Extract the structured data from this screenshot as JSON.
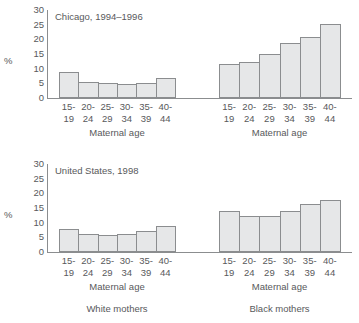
{
  "chart_data": [
    {
      "type": "bar",
      "title": "Chicago, 1994–1996",
      "xlabel": "Maternal age",
      "ylabel": "%",
      "ylim": [
        0,
        30
      ],
      "yticks": [
        30,
        25,
        20,
        15,
        10,
        5,
        0
      ],
      "grid": false,
      "legend": "none",
      "categories": [
        "15-19",
        "20-24",
        "25-29",
        "30-34",
        "35-39",
        "40-44"
      ],
      "category_lines": [
        {
          "l1": "15-",
          "l2": "19"
        },
        {
          "l1": "20-",
          "l2": "24"
        },
        {
          "l1": "25-",
          "l2": "29"
        },
        {
          "l1": "30-",
          "l2": "34"
        },
        {
          "l1": "35-",
          "l2": "39"
        },
        {
          "l1": "40-",
          "l2": "44"
        }
      ],
      "series": [
        {
          "name": "White mothers",
          "values": [
            9.0,
            5.5,
            5.0,
            4.7,
            5.1,
            6.7
          ]
        },
        {
          "name": "Black mothers",
          "values": [
            11.5,
            12.2,
            14.9,
            18.6,
            20.9,
            25.3
          ]
        }
      ]
    },
    {
      "type": "bar",
      "title": "United States, 1998",
      "xlabel": "Maternal age",
      "ylabel": "%",
      "ylim": [
        0,
        30
      ],
      "yticks": [
        30,
        25,
        20,
        15,
        10,
        5,
        0
      ],
      "grid": false,
      "legend": "none",
      "categories": [
        "15-19",
        "20-24",
        "25-29",
        "30-34",
        "35-39",
        "40-44"
      ],
      "category_lines": [
        {
          "l1": "15-",
          "l2": "19"
        },
        {
          "l1": "20-",
          "l2": "24"
        },
        {
          "l1": "25-",
          "l2": "29"
        },
        {
          "l1": "30-",
          "l2": "34"
        },
        {
          "l1": "35-",
          "l2": "39"
        },
        {
          "l1": "40-",
          "l2": "44"
        }
      ],
      "series": [
        {
          "name": "White mothers",
          "values": [
            8.0,
            6.3,
            5.7,
            6.0,
            7.3,
            9.0
          ]
        },
        {
          "name": "Black mothers",
          "values": [
            14.0,
            12.4,
            12.4,
            14.1,
            16.3,
            17.8
          ]
        }
      ]
    }
  ],
  "colors": {
    "bar_fill": "#e6e7e8",
    "bar_stroke": "#8b8d8f",
    "axis": "#8b8d8f",
    "text": "#58595b",
    "background": "#ffffff"
  },
  "group_captions": {
    "white": "White mothers",
    "black": "Black mothers"
  }
}
